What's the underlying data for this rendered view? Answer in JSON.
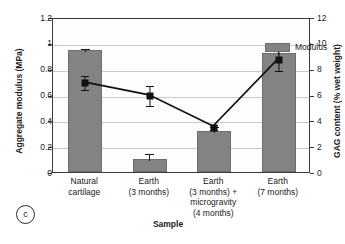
{
  "panel": {
    "tag": "c"
  },
  "legend": {
    "entries": [
      {
        "label": "Modulus",
        "color": "#838383",
        "type": "bar"
      }
    ]
  },
  "chart_data": {
    "type": "bar",
    "title": "",
    "subtitle": "",
    "xlabel": "Sample",
    "ylabel": "Aggregate modulus (MPa)",
    "y2label": "GAG content (% wet weight)",
    "grid": true,
    "legend_position": "top-right",
    "categories": [
      "Natural cartilage",
      "Earth (3 months)",
      "Earth (3 months) + microgravity (4 months)",
      "Earth (7 months)"
    ],
    "category_lines": [
      [
        "Natural",
        "cartilage"
      ],
      [
        "Earth",
        "(3 months)"
      ],
      [
        "Earth",
        "(3 months) +",
        "microgravity",
        "(4 months)"
      ],
      [
        "Earth",
        "(7 months)"
      ]
    ],
    "ylim": [
      0,
      1.2
    ],
    "yticks": [
      0,
      0.2,
      0.4,
      0.6,
      0.8,
      1,
      1.2
    ],
    "ytick_labels": [
      "0",
      "0.2",
      "0.4",
      "0.6",
      "0.8",
      "1",
      "1.2"
    ],
    "y2lim": [
      0,
      12
    ],
    "y2ticks": [
      0,
      2,
      4,
      6,
      8,
      10,
      12
    ],
    "y2tick_labels": [
      "0",
      "2",
      "4",
      "6",
      "8",
      "10",
      "12"
    ],
    "series": [
      {
        "name": "Modulus",
        "type": "bar",
        "axis": "left",
        "color": "#838383",
        "values": [
          0.945,
          0.1,
          0.315,
          0.925
        ],
        "errors": [
          0.025,
          0.055,
          0.05,
          0.06
        ]
      },
      {
        "name": "GAG content",
        "type": "line",
        "axis": "right",
        "color": "#111111",
        "marker": "square",
        "values": [
          7.05,
          6.05,
          3.6,
          8.8
        ],
        "errors": [
          0.55,
          0.75,
          0.2,
          0.85
        ]
      }
    ]
  }
}
